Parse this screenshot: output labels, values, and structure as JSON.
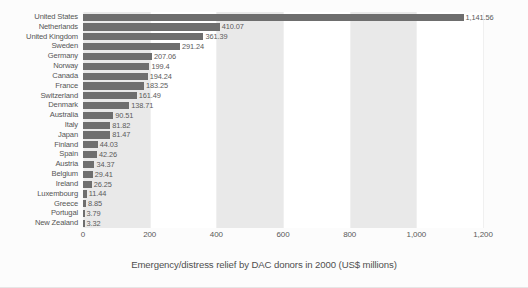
{
  "chart_data": {
    "type": "bar",
    "orientation": "horizontal",
    "title": "",
    "caption": "Emergency/distress relief by DAC donors in 2000 (US$ millions)",
    "xlabel": "",
    "ylabel": "",
    "xlim": [
      0,
      1200
    ],
    "grid": false,
    "legend": "none",
    "bar_color": "#6e6e6e",
    "band_color": "#e9e9e9",
    "shaded_band_ranges": [
      [
        0,
        200
      ],
      [
        400,
        600
      ],
      [
        800,
        1000
      ]
    ],
    "tick_labels": [
      "0",
      "200",
      "400",
      "600",
      "800",
      "1,000",
      "1,200"
    ],
    "tick_values": [
      0,
      200,
      400,
      600,
      800,
      1000,
      1200
    ],
    "categories": [
      "United States",
      "Netherlands",
      "United Kingdom",
      "Sweden",
      "Germany",
      "Norway",
      "Canada",
      "France",
      "Switzerland",
      "Denmark",
      "Australia",
      "Italy",
      "Japan",
      "Finland",
      "Spain",
      "Austria",
      "Belgium",
      "Ireland",
      "Luxembourg",
      "Greece",
      "Portugal",
      "New Zealand"
    ],
    "values": [
      1141.56,
      410.07,
      361.39,
      291.24,
      207.06,
      199.4,
      194.24,
      183.25,
      161.49,
      138.71,
      90.51,
      81.82,
      81.47,
      44.03,
      42.26,
      34.37,
      29.41,
      26.25,
      11.44,
      8.85,
      3.79,
      3.32
    ],
    "value_labels": [
      "1,141.56",
      "410.07",
      "361.39",
      "291.24",
      "207.06",
      "199.4",
      "194.24",
      "183.25",
      "161.49",
      "138.71",
      "90.51",
      "81.82",
      "81.47",
      "44.03",
      "42.26",
      "34.37",
      "29.41",
      "26.25",
      "11.44",
      "8.85",
      "3.79",
      "3.32"
    ]
  }
}
